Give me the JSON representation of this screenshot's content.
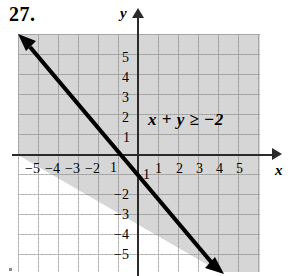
{
  "problem": {
    "number": "27."
  },
  "graph": {
    "inequality_label": "x + y ≥ −2",
    "axis_labels": {
      "x": "x",
      "y": "y"
    },
    "x_ticks": [
      {
        "value": -5,
        "label": "−5",
        "x": 25,
        "y": 162
      },
      {
        "value": -4,
        "label": "−4",
        "x": 45,
        "y": 162
      },
      {
        "value": -3,
        "label": "−3",
        "x": 65,
        "y": 162
      },
      {
        "value": -2,
        "label": "−2",
        "x": 85,
        "y": 162
      },
      {
        "value": -1,
        "label": "1",
        "x": 110,
        "y": 161
      },
      {
        "value": 1,
        "label": "1",
        "x": 155,
        "y": 162
      },
      {
        "value": 2,
        "label": "2",
        "x": 176,
        "y": 162
      },
      {
        "value": 3,
        "label": "3",
        "x": 196,
        "y": 162
      },
      {
        "value": 4,
        "label": "4",
        "x": 216,
        "y": 162
      },
      {
        "value": 5,
        "label": "5",
        "x": 236,
        "y": 162
      }
    ],
    "y_ticks": [
      {
        "value": 5,
        "label": "5",
        "x": 122,
        "y": 51
      },
      {
        "value": 4,
        "label": "4",
        "x": 122,
        "y": 71
      },
      {
        "value": 3,
        "label": "3",
        "x": 122,
        "y": 91
      },
      {
        "value": 2,
        "label": "2",
        "x": 122,
        "y": 111
      },
      {
        "value": 1,
        "label": "1",
        "x": 123,
        "y": 131
      },
      {
        "value": -1,
        "label": "1",
        "x": 143,
        "y": 168
      },
      {
        "value": -2,
        "label": "−2",
        "x": 114,
        "y": 188
      },
      {
        "value": -3,
        "label": "−3",
        "x": 114,
        "y": 208
      },
      {
        "value": -4,
        "label": "−4",
        "x": 114,
        "y": 228
      },
      {
        "value": -5,
        "label": "−5",
        "x": 114,
        "y": 248
      }
    ]
  },
  "chart_data": {
    "type": "line",
    "title": "27.",
    "xlabel": "x",
    "ylabel": "y",
    "xlim": [
      -6,
      7
    ],
    "ylim": [
      -6,
      6
    ],
    "grid": true,
    "legend": null,
    "annotations": [
      {
        "text": "x + y ≥ −2",
        "x": 2.2,
        "y": 1.6
      }
    ],
    "series": [
      {
        "name": "x + y = -2",
        "type": "line",
        "style": "solid",
        "color": "#000000",
        "equation": "y = -x - 2",
        "slope": -1,
        "intercept": -2,
        "x_intercept": -2,
        "y_intercept": -2,
        "points": [
          {
            "x": -6,
            "y": 4
          },
          {
            "x": -2,
            "y": 0
          },
          {
            "x": 0,
            "y": -2
          },
          {
            "x": 4,
            "y": -6
          }
        ],
        "arrows": "both"
      }
    ],
    "shaded_regions": [
      {
        "name": "solution-set",
        "inequality": "x + y >= -2",
        "side": "above-right",
        "boundary_included": true,
        "fill": "#d6d6d6"
      }
    ]
  },
  "colors": {
    "shading": "#d6d6d6",
    "axis": "#2b2b2b",
    "line": "#000000",
    "grid_dot": "#787878",
    "background": "#ffffff"
  }
}
